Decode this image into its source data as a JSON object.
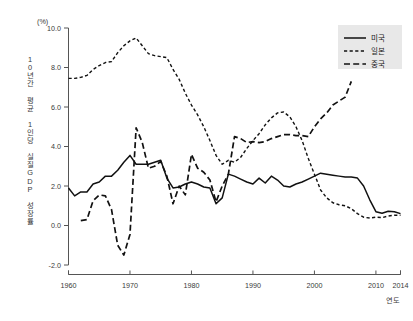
{
  "chart_data": {
    "type": "line",
    "title": "",
    "unit_label": "(%)",
    "xlabel": "연도",
    "ylabel": "10년간 평균 1인당 실질GDP 성장률",
    "xlim": [
      1960,
      2014
    ],
    "ylim": [
      -2.0,
      10.0
    ],
    "xticks": [
      1960,
      1970,
      1980,
      1990,
      2000,
      2010,
      2014
    ],
    "xtick_labels": [
      "1960",
      "1970",
      "1980",
      "1990",
      "2000",
      "2010",
      "2014"
    ],
    "yticks": [
      -2.0,
      0.0,
      2.0,
      4.0,
      6.0,
      8.0,
      10.0
    ],
    "ytick_labels": [
      "-2.0",
      "0.0",
      "2.0",
      "4.0",
      "6.0",
      "8.0",
      "10.0"
    ],
    "grid": false,
    "legend_position": "top-right",
    "series": [
      {
        "name": "미국",
        "style": "solid",
        "color": "#111111",
        "x": [
          1960,
          1961,
          1962,
          1963,
          1964,
          1965,
          1966,
          1967,
          1968,
          1969,
          1970,
          1971,
          1972,
          1973,
          1974,
          1975,
          1976,
          1977,
          1978,
          1979,
          1980,
          1981,
          1982,
          1983,
          1984,
          1985,
          1986,
          1987,
          1988,
          1989,
          1990,
          1991,
          1992,
          1993,
          1994,
          1995,
          1996,
          1997,
          1998,
          1999,
          2000,
          2001,
          2002,
          2003,
          2004,
          2005,
          2006,
          2007,
          2008,
          2009,
          2010,
          2011,
          2012,
          2013,
          2014
        ],
        "y": [
          1.9,
          1.5,
          1.7,
          1.7,
          2.1,
          2.2,
          2.5,
          2.5,
          2.8,
          3.2,
          3.55,
          3.1,
          3.1,
          3.1,
          3.2,
          3.3,
          2.4,
          1.9,
          1.95,
          2.1,
          2.2,
          2.1,
          1.95,
          1.9,
          1.1,
          1.4,
          2.6,
          2.5,
          2.35,
          2.2,
          2.1,
          2.4,
          2.15,
          2.5,
          2.3,
          2.0,
          1.95,
          2.1,
          2.2,
          2.35,
          2.5,
          2.65,
          2.6,
          2.55,
          2.5,
          2.45,
          2.45,
          2.4,
          2.0,
          1.3,
          0.7,
          0.62,
          0.72,
          0.7,
          0.6
        ]
      },
      {
        "name": "일본",
        "style": "dotted-dash",
        "color": "#111111",
        "x": [
          1960,
          1961,
          1962,
          1963,
          1964,
          1965,
          1966,
          1967,
          1968,
          1969,
          1970,
          1971,
          1972,
          1973,
          1974,
          1975,
          1976,
          1977,
          1978,
          1979,
          1980,
          1981,
          1982,
          1983,
          1984,
          1985,
          1986,
          1987,
          1988,
          1989,
          1990,
          1991,
          1992,
          1993,
          1994,
          1995,
          1996,
          1997,
          1998,
          1999,
          2000,
          2001,
          2002,
          2003,
          2004,
          2005,
          2006,
          2007,
          2008,
          2009,
          2010,
          2011,
          2012,
          2013,
          2014
        ],
        "y": [
          7.45,
          7.45,
          7.5,
          7.6,
          7.9,
          8.1,
          8.25,
          8.3,
          8.75,
          9.1,
          9.35,
          9.5,
          9.1,
          8.7,
          8.6,
          8.55,
          8.5,
          7.9,
          7.4,
          6.7,
          6.1,
          5.6,
          5.0,
          4.3,
          3.55,
          3.1,
          3.3,
          3.2,
          3.45,
          3.9,
          4.3,
          4.65,
          5.1,
          5.45,
          5.7,
          5.75,
          5.5,
          5.0,
          4.3,
          3.4,
          2.6,
          1.8,
          1.4,
          1.15,
          1.05,
          1.0,
          0.85,
          0.6,
          0.42,
          0.38,
          0.42,
          0.4,
          0.48,
          0.52,
          0.52
        ]
      },
      {
        "name": "중국",
        "style": "dashed",
        "color": "#111111",
        "x": [
          1962,
          1963,
          1964,
          1965,
          1966,
          1967,
          1968,
          1969,
          1970,
          1971,
          1972,
          1973,
          1974,
          1975,
          1976,
          1977,
          1978,
          1979,
          1980,
          1981,
          1982,
          1983,
          1984,
          1985,
          1986,
          1987,
          1988,
          1989,
          1990,
          1991,
          1992,
          1993,
          1994,
          1995,
          1996,
          1997,
          1998,
          1999,
          2000,
          2001,
          2002,
          2003,
          2004,
          2005,
          2006
        ],
        "y": [
          0.25,
          0.3,
          1.25,
          1.55,
          1.5,
          0.8,
          -1.0,
          -1.5,
          -0.45,
          4.95,
          4.2,
          2.9,
          3.0,
          3.25,
          2.5,
          1.1,
          2.0,
          1.55,
          3.6,
          2.9,
          2.7,
          2.3,
          1.2,
          2.0,
          2.6,
          4.5,
          4.4,
          4.2,
          4.25,
          4.2,
          4.25,
          4.4,
          4.5,
          4.6,
          4.6,
          4.55,
          4.55,
          4.5,
          5.0,
          5.4,
          5.7,
          6.1,
          6.3,
          6.5,
          7.3
        ]
      }
    ]
  },
  "legend": {
    "items": [
      {
        "label": "미국",
        "style": "solid"
      },
      {
        "label": "일본",
        "style": "dotted-dash"
      },
      {
        "label": "중국",
        "style": "dashed"
      }
    ]
  },
  "colors": {
    "line": "#111111",
    "axis": "#555555",
    "text": "#3a3a3a",
    "legend_background": "#e8e8e8",
    "background": "#ffffff"
  }
}
